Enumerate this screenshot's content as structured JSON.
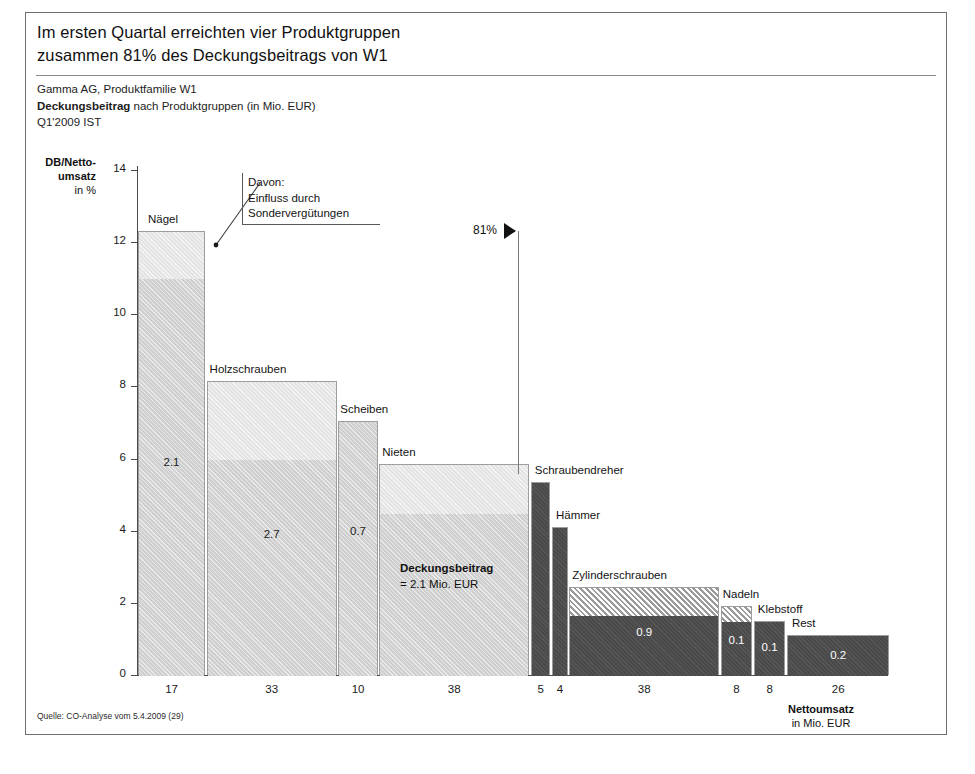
{
  "slide": {
    "headline_line1": "Im ersten Quartal erreichten vier Produktgruppen",
    "headline_line2": "zusammen 81% des Deckungsbeitrags von W1",
    "sub_line1": "Gamma AG, Produktfamilie W1",
    "sub_line2_bold": "Deckungsbeitrag",
    "sub_line2_rest": " nach Produktgruppen (in Mio. EUR)",
    "sub_line3": "Q1'2009 IST",
    "source": "Quelle: CO-Analyse vom 5.4.2009 (29)"
  },
  "annotations": {
    "callout_line1": "Davon:",
    "callout_line2": "Einfluss durch",
    "callout_line3": "Sondervergütungen",
    "pct_marker": "81%",
    "db_note_bold": "Deckungsbeitrag",
    "db_note_rest": "= 2.1 Mio. EUR"
  },
  "chart_data": {
    "type": "bar",
    "title": "Im ersten Quartal erreichten vier Produktgruppen zusammen 81% des Deckungsbeitrags von W1",
    "subtitle": "Gamma AG, Produktfamilie W1 — Deckungsbeitrag nach Produktgruppen (in Mio. EUR) — Q1'2009 IST",
    "xlabel": "Nettoumsatz in Mio. EUR",
    "ylabel": "DB/Nettoumsatz in %",
    "ylim": [
      0,
      14
    ],
    "yticks": [
      0,
      2,
      4,
      6,
      8,
      10,
      12,
      14
    ],
    "ytick_labels": [
      "0",
      "2",
      "4",
      "6",
      "8",
      "10",
      "12",
      "14"
    ],
    "grid": false,
    "legend": "none",
    "note": "Marimekko / mekko chart: bar width = Nettoumsatz (Mio. EUR), bar height = DB/Nettoumsatz (%), light upper segment = Einfluss durch Sondervergütungen",
    "categories": [
      "Nägel",
      "Holzschrauben",
      "Scheiben",
      "Nieten",
      "Schraubendreher",
      "Hämmer",
      "Zylinderschrauben",
      "Nadeln",
      "Klebstoff",
      "Rest"
    ],
    "widths": [
      17,
      33,
      10,
      38,
      5,
      4,
      38,
      8,
      8,
      26
    ],
    "width_labels": [
      "17",
      "33",
      "10",
      "38",
      "5",
      "4",
      "38",
      "8",
      "8",
      "26"
    ],
    "heights": [
      12.3,
      8.15,
      7.05,
      5.85,
      5.35,
      4.1,
      2.45,
      1.9,
      1.5,
      1.1
    ],
    "base_heights": [
      11.0,
      6.0,
      7.05,
      4.5,
      5.35,
      4.1,
      1.65,
      1.5,
      1.5,
      1.1
    ],
    "value_labels": [
      "2.1",
      "2.7",
      "0.7",
      "",
      "",
      "",
      "0.9",
      "0.1",
      "0.1",
      "0.2"
    ],
    "styles": [
      "light-with-pale-top",
      "light-with-pale-top",
      "light",
      "light-with-pale-top",
      "dark",
      "dark",
      "dark-with-hatch-top",
      "dark-with-hatch-top",
      "dark",
      "dark"
    ],
    "annotations": [
      "81% cumulative-share marker after Nieten",
      "Deckungsbeitrag = 2.1 Mio. EUR inside Nieten bar"
    ]
  }
}
